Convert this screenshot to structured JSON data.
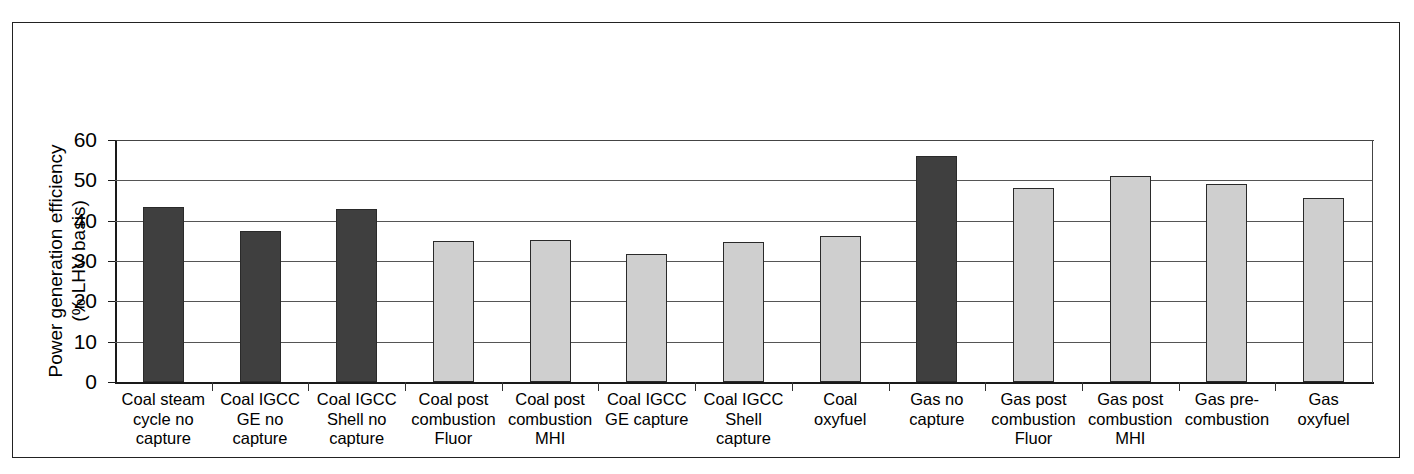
{
  "figure": {
    "y_axis_title": "Power generation efficiency\n(% LHV basis)"
  },
  "chart_data": {
    "type": "bar",
    "title": "",
    "xlabel": "",
    "ylabel": "Power generation efficiency (% LHV basis)",
    "ylim": [
      0,
      60
    ],
    "yticks": [
      0,
      10,
      20,
      30,
      40,
      50,
      60
    ],
    "ytick_labels": [
      "0",
      "10",
      "20",
      "30",
      "40",
      "50",
      "60"
    ],
    "grid": true,
    "legend_position": "none",
    "categories": [
      "Coal steam\ncycle no\ncapture",
      "Coal IGCC\nGE no\ncapture",
      "Coal IGCC\nShell no\ncapture",
      "Coal post\ncombustion\nFluor",
      "Coal post\ncombustion\nMHI",
      "Coal IGCC\nGE capture",
      "Coal IGCC\nShell\ncapture",
      "Coal\noxyfuel",
      "Gas no\ncapture",
      "Gas post\ncombustion\nFluor",
      "Gas post\ncombustion\nMHI",
      "Gas pre-\ncombustion",
      "Gas\noxyfuel"
    ],
    "values": [
      43.4,
      37.5,
      43.0,
      35.0,
      35.2,
      31.8,
      34.7,
      36.2,
      56.0,
      48.2,
      51.1,
      49.0,
      45.6
    ],
    "bar_styles": [
      "dark",
      "dark",
      "dark",
      "light",
      "light",
      "light",
      "light",
      "light",
      "dark",
      "light",
      "light",
      "light",
      "light"
    ],
    "colors": {
      "dark": "#3f3f3f",
      "light": "#cfcfcf",
      "bar_border": "#2a2a2a",
      "axis": "#1a1a1a",
      "gridline": "#555555",
      "frame": "#222222",
      "background": "#ffffff"
    }
  }
}
